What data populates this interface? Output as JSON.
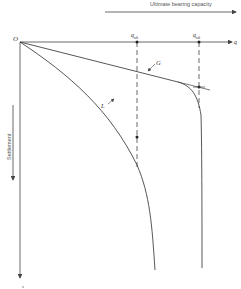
{
  "diagram": {
    "title_arrow_label": "Ultimate bearing capacity",
    "origin_label": "O",
    "x_axis_label": "q",
    "y_axis_label": "s",
    "settlement_label": "Settlement",
    "curves": [
      {
        "id": "L",
        "label": "L",
        "description": "local shear failure curve"
      },
      {
        "id": "G",
        "label": "G",
        "description": "general shear failure curve"
      }
    ],
    "markers": [
      {
        "label": "q_ult",
        "text": "q",
        "sub": "ult",
        "curve": "L"
      },
      {
        "label": "q_ult",
        "text": "q",
        "sub": "ult",
        "curve": "G"
      }
    ],
    "colors": {
      "line": "#444444",
      "text": "#333333",
      "background": "#ffffff"
    }
  }
}
